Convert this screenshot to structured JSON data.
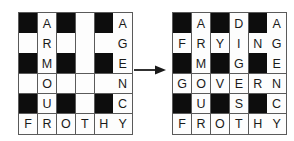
{
  "figure": {
    "name": "crossword-transformation",
    "arrow_icon": "arrow-right-icon",
    "colors": {
      "block": "#0d0d0d",
      "cell": "#fdfdfd",
      "grid_line": "#5a5a5a",
      "letter": "#1a1a1a"
    }
  },
  "grids": [
    {
      "id": "grid-left",
      "label": "partially filled crossword grid",
      "rows": 6,
      "columns": 6,
      "cells": [
        [
          {
            "type": "block",
            "letter": ""
          },
          {
            "type": "letter",
            "letter": "A"
          },
          {
            "type": "block",
            "letter": ""
          },
          {
            "type": "empty",
            "letter": ""
          },
          {
            "type": "block",
            "letter": ""
          },
          {
            "type": "letter",
            "letter": "A"
          }
        ],
        [
          {
            "type": "empty",
            "letter": ""
          },
          {
            "type": "letter",
            "letter": "R"
          },
          {
            "type": "empty",
            "letter": ""
          },
          {
            "type": "empty",
            "letter": ""
          },
          {
            "type": "empty",
            "letter": ""
          },
          {
            "type": "letter",
            "letter": "G"
          }
        ],
        [
          {
            "type": "block",
            "letter": ""
          },
          {
            "type": "letter",
            "letter": "M"
          },
          {
            "type": "block",
            "letter": ""
          },
          {
            "type": "empty",
            "letter": ""
          },
          {
            "type": "block",
            "letter": ""
          },
          {
            "type": "letter",
            "letter": "E"
          }
        ],
        [
          {
            "type": "empty",
            "letter": ""
          },
          {
            "type": "letter",
            "letter": "O"
          },
          {
            "type": "empty",
            "letter": ""
          },
          {
            "type": "empty",
            "letter": ""
          },
          {
            "type": "empty",
            "letter": ""
          },
          {
            "type": "letter",
            "letter": "N"
          }
        ],
        [
          {
            "type": "block",
            "letter": ""
          },
          {
            "type": "letter",
            "letter": "U"
          },
          {
            "type": "block",
            "letter": ""
          },
          {
            "type": "empty",
            "letter": ""
          },
          {
            "type": "block",
            "letter": ""
          },
          {
            "type": "letter",
            "letter": "C"
          }
        ],
        [
          {
            "type": "letter",
            "letter": "F"
          },
          {
            "type": "letter",
            "letter": "R"
          },
          {
            "type": "letter",
            "letter": "O"
          },
          {
            "type": "letter",
            "letter": "T"
          },
          {
            "type": "letter",
            "letter": "H"
          },
          {
            "type": "letter",
            "letter": "Y"
          }
        ]
      ]
    },
    {
      "id": "grid-right",
      "label": "completed crossword grid",
      "rows": 6,
      "columns": 6,
      "cells": [
        [
          {
            "type": "block",
            "letter": ""
          },
          {
            "type": "letter",
            "letter": "A"
          },
          {
            "type": "block",
            "letter": ""
          },
          {
            "type": "letter",
            "letter": "D"
          },
          {
            "type": "block",
            "letter": ""
          },
          {
            "type": "letter",
            "letter": "A"
          }
        ],
        [
          {
            "type": "letter",
            "letter": "F"
          },
          {
            "type": "letter",
            "letter": "R"
          },
          {
            "type": "letter",
            "letter": "Y"
          },
          {
            "type": "letter",
            "letter": "I"
          },
          {
            "type": "letter",
            "letter": "N"
          },
          {
            "type": "letter",
            "letter": "G"
          }
        ],
        [
          {
            "type": "block",
            "letter": ""
          },
          {
            "type": "letter",
            "letter": "M"
          },
          {
            "type": "block",
            "letter": ""
          },
          {
            "type": "letter",
            "letter": "G"
          },
          {
            "type": "block",
            "letter": ""
          },
          {
            "type": "letter",
            "letter": "E"
          }
        ],
        [
          {
            "type": "letter",
            "letter": "G"
          },
          {
            "type": "letter",
            "letter": "O"
          },
          {
            "type": "letter",
            "letter": "V"
          },
          {
            "type": "letter",
            "letter": "E"
          },
          {
            "type": "letter",
            "letter": "R"
          },
          {
            "type": "letter",
            "letter": "N"
          }
        ],
        [
          {
            "type": "block",
            "letter": ""
          },
          {
            "type": "letter",
            "letter": "U"
          },
          {
            "type": "block",
            "letter": ""
          },
          {
            "type": "letter",
            "letter": "S"
          },
          {
            "type": "block",
            "letter": ""
          },
          {
            "type": "letter",
            "letter": "C"
          }
        ],
        [
          {
            "type": "letter",
            "letter": "F"
          },
          {
            "type": "letter",
            "letter": "R"
          },
          {
            "type": "letter",
            "letter": "O"
          },
          {
            "type": "letter",
            "letter": "T"
          },
          {
            "type": "letter",
            "letter": "H"
          },
          {
            "type": "letter",
            "letter": "Y"
          }
        ]
      ]
    }
  ]
}
